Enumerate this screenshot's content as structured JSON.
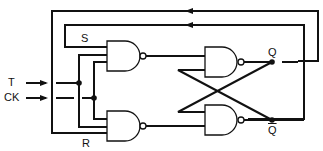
{
  "diagram": {
    "type": "logic-circuit",
    "labels": {
      "t_input": "T",
      "ck_input": "CK",
      "s_line": "S",
      "r_line": "R",
      "q_output": "Q",
      "qbar_output": "Q"
    },
    "gates": [
      {
        "id": "nand-s",
        "type": "NAND",
        "inputs": 3
      },
      {
        "id": "nand-r",
        "type": "NAND",
        "inputs": 3
      },
      {
        "id": "nand-q",
        "type": "NAND",
        "inputs": 2
      },
      {
        "id": "nand-qbar",
        "type": "NAND",
        "inputs": 2
      }
    ],
    "colors": {
      "line": "#111111",
      "background": "#ffffff"
    }
  }
}
